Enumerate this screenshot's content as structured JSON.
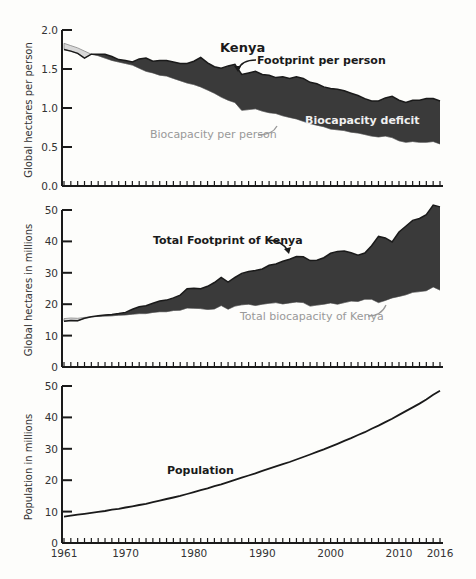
{
  "colors": {
    "deficit_fill": "#3a3a3a",
    "reserve_fill": "#d8d8d8",
    "axis": "#1a1a1a",
    "grey_text": "#999999"
  },
  "chart_data": [
    {
      "type": "area",
      "title": "Kenya",
      "xlabel": "",
      "ylabel": "Global hectares per person",
      "ylim": [
        0,
        2.0
      ],
      "yticks": [
        "0.0",
        "0.5",
        "1.0",
        "1.5",
        "2.0"
      ],
      "x": [
        1961,
        1962,
        1963,
        1964,
        1965,
        1966,
        1967,
        1968,
        1969,
        1970,
        1971,
        1972,
        1973,
        1974,
        1975,
        1976,
        1977,
        1978,
        1979,
        1980,
        1981,
        1982,
        1983,
        1984,
        1985,
        1986,
        1987,
        1988,
        1989,
        1990,
        1991,
        1992,
        1993,
        1994,
        1995,
        1996,
        1997,
        1998,
        1999,
        2000,
        2001,
        2002,
        2003,
        2004,
        2005,
        2006,
        2007,
        2008,
        2009,
        2010,
        2011,
        2012,
        2013,
        2014,
        2015,
        2016
      ],
      "series": [
        {
          "name": "Footprint per person",
          "values": [
            1.75,
            1.73,
            1.7,
            1.64,
            1.69,
            1.69,
            1.69,
            1.66,
            1.62,
            1.61,
            1.59,
            1.63,
            1.64,
            1.6,
            1.61,
            1.61,
            1.59,
            1.57,
            1.57,
            1.6,
            1.65,
            1.58,
            1.53,
            1.51,
            1.54,
            1.56,
            1.43,
            1.45,
            1.47,
            1.43,
            1.42,
            1.39,
            1.4,
            1.38,
            1.4,
            1.38,
            1.33,
            1.31,
            1.27,
            1.25,
            1.24,
            1.22,
            1.19,
            1.16,
            1.12,
            1.09,
            1.09,
            1.13,
            1.15,
            1.1,
            1.07,
            1.1,
            1.1,
            1.12,
            1.12,
            1.09
          ]
        },
        {
          "name": "Biocapacity per person",
          "values": [
            1.83,
            1.8,
            1.77,
            1.73,
            1.69,
            1.67,
            1.64,
            1.61,
            1.59,
            1.57,
            1.55,
            1.51,
            1.47,
            1.45,
            1.42,
            1.41,
            1.38,
            1.35,
            1.32,
            1.3,
            1.27,
            1.23,
            1.19,
            1.14,
            1.1,
            1.07,
            0.97,
            0.98,
            0.99,
            0.96,
            0.94,
            0.93,
            0.9,
            0.88,
            0.86,
            0.83,
            0.8,
            0.78,
            0.76,
            0.73,
            0.72,
            0.71,
            0.69,
            0.68,
            0.66,
            0.64,
            0.63,
            0.64,
            0.62,
            0.58,
            0.56,
            0.57,
            0.56,
            0.56,
            0.57,
            0.54
          ]
        }
      ],
      "annotations": [
        "Footprint per person",
        "Biocapacity per person",
        "Biocapacity deficit"
      ],
      "grid": false
    },
    {
      "type": "area",
      "title": "",
      "xlabel": "",
      "ylabel": "Global hectares in millions",
      "ylim": [
        0,
        50
      ],
      "yticks": [
        "0",
        "10",
        "20",
        "30",
        "40",
        "50"
      ],
      "x": [
        1961,
        1962,
        1963,
        1964,
        1965,
        1966,
        1967,
        1968,
        1969,
        1970,
        1971,
        1972,
        1973,
        1974,
        1975,
        1976,
        1977,
        1978,
        1979,
        1980,
        1981,
        1982,
        1983,
        1984,
        1985,
        1986,
        1987,
        1988,
        1989,
        1990,
        1991,
        1992,
        1993,
        1994,
        1995,
        1996,
        1997,
        1998,
        1999,
        2000,
        2001,
        2002,
        2003,
        2004,
        2005,
        2006,
        2007,
        2008,
        2009,
        2010,
        2011,
        2012,
        2013,
        2014,
        2015,
        2016
      ],
      "series": [
        {
          "name": "Total Footprint of Kenya",
          "values": [
            14.6,
            14.8,
            14.7,
            15.5,
            16.0,
            16.3,
            16.6,
            16.7,
            17.0,
            17.4,
            18.4,
            19.2,
            19.5,
            20.3,
            21.0,
            21.3,
            22.0,
            22.9,
            24.9,
            25.1,
            24.9,
            25.7,
            26.9,
            28.5,
            27.0,
            28.5,
            29.8,
            30.4,
            30.7,
            31.2,
            32.4,
            32.8,
            33.7,
            34.3,
            35.2,
            35.1,
            33.9,
            34.0,
            34.8,
            36.2,
            36.8,
            36.9,
            36.4,
            35.6,
            36.3,
            38.6,
            41.6,
            41.1,
            39.8,
            43.0,
            44.8,
            46.7,
            47.3,
            48.5,
            51.6,
            51.0
          ]
        },
        {
          "name": "Total biocapacity of Kenya",
          "values": [
            15.4,
            15.6,
            15.5,
            15.8,
            16.0,
            16.1,
            16.2,
            16.3,
            16.5,
            16.6,
            16.8,
            17.0,
            17.0,
            17.4,
            17.6,
            17.6,
            18.0,
            18.1,
            18.8,
            18.7,
            18.6,
            18.3,
            18.5,
            19.6,
            18.4,
            19.4,
            19.8,
            20.0,
            19.6,
            20.0,
            20.3,
            20.5,
            20.1,
            20.4,
            20.7,
            20.5,
            19.4,
            19.7,
            20.0,
            20.4,
            20.0,
            20.5,
            21.0,
            20.9,
            21.6,
            21.6,
            20.5,
            21.2,
            22.0,
            22.5,
            23.0,
            23.8,
            24.0,
            24.3,
            25.5,
            24.5
          ]
        }
      ],
      "annotations": [
        "Total Footprint of Kenya",
        "Total biocapacity of Kenya"
      ],
      "grid": false
    },
    {
      "type": "line",
      "title": "",
      "xlabel": "",
      "ylabel": "Population in millions",
      "ylim": [
        0,
        50
      ],
      "yticks": [
        "0",
        "10",
        "20",
        "30",
        "40",
        "50"
      ],
      "xticks": [
        "1961",
        "1970",
        "1980",
        "1990",
        "2000",
        "2010",
        "2016"
      ],
      "x": [
        1961,
        1962,
        1963,
        1964,
        1965,
        1966,
        1967,
        1968,
        1969,
        1970,
        1971,
        1972,
        1973,
        1974,
        1975,
        1976,
        1977,
        1978,
        1979,
        1980,
        1981,
        1982,
        1983,
        1984,
        1985,
        1986,
        1987,
        1988,
        1989,
        1990,
        1991,
        1992,
        1993,
        1994,
        1995,
        1996,
        1997,
        1998,
        1999,
        2000,
        2001,
        2002,
        2003,
        2004,
        2005,
        2006,
        2007,
        2008,
        2009,
        2010,
        2011,
        2012,
        2013,
        2014,
        2015,
        2016
      ],
      "series": [
        {
          "name": "Population",
          "values": [
            8.4,
            8.7,
            9.0,
            9.3,
            9.6,
            9.9,
            10.2,
            10.6,
            10.9,
            11.3,
            11.7,
            12.1,
            12.5,
            13.0,
            13.5,
            14.0,
            14.5,
            15.0,
            15.6,
            16.2,
            16.8,
            17.4,
            18.1,
            18.7,
            19.4,
            20.1,
            20.8,
            21.5,
            22.2,
            23.0,
            23.7,
            24.4,
            25.1,
            25.8,
            26.6,
            27.4,
            28.2,
            29.0,
            29.8,
            30.7,
            31.6,
            32.5,
            33.4,
            34.4,
            35.3,
            36.4,
            37.4,
            38.5,
            39.6,
            40.8,
            42.0,
            43.2,
            44.4,
            45.7,
            47.2,
            48.5
          ]
        }
      ],
      "annotations": [
        "Population"
      ],
      "grid": false
    }
  ],
  "labels": {
    "top_title": "Kenya",
    "top_ylabel": "Global hectares per person",
    "top_anno_footprint": "Footprint per person",
    "top_anno_biocap": "Biocapacity per person",
    "top_anno_deficit": "Biocapacity deficit",
    "mid_ylabel": "Global hectares in millions",
    "mid_anno_footprint": "Total Footprint of Kenya",
    "mid_anno_biocap": "Total biocapacity of Kenya",
    "bot_ylabel": "Population in millions",
    "bot_anno_pop": "Population",
    "top_yticks": [
      "0.0",
      "0.5",
      "1.0",
      "1.5",
      "2.0"
    ],
    "mid_yticks": [
      "0",
      "10",
      "20",
      "30",
      "40",
      "50"
    ],
    "bot_yticks": [
      "0",
      "10",
      "20",
      "30",
      "40",
      "50"
    ],
    "xticks": [
      "1961",
      "1970",
      "1980",
      "1990",
      "2000",
      "2010",
      "2016"
    ]
  }
}
